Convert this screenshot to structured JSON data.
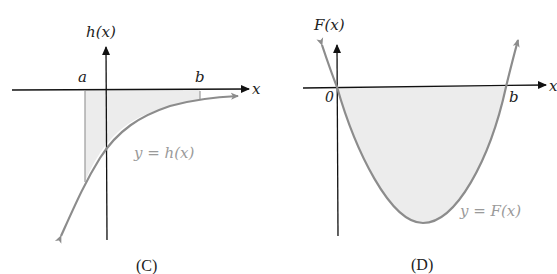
{
  "panels": [
    {
      "id": "C",
      "caption": "(C)",
      "y_axis_label": "h(x)",
      "x_axis_label": "x",
      "bound_a": "a",
      "bound_b": "b",
      "curve_label": "y = h(x)",
      "description": "Increasing concave-down curve below x-axis; region between curve and x-axis from a to b shaded"
    },
    {
      "id": "D",
      "caption": "(D)",
      "y_axis_label": "F(x)",
      "x_axis_label": "x",
      "origin_label": "0",
      "bound_b": "b",
      "curve_label": "y = F(x)",
      "description": "Upward parabola with roots at 0 and b; region between curve and x-axis from 0 to b shaded"
    }
  ],
  "colors": {
    "axis": "#111111",
    "curve": "#8c8c8c",
    "fill": "#ececec",
    "curve_label": "#9a9a9a",
    "text": "#222222"
  }
}
